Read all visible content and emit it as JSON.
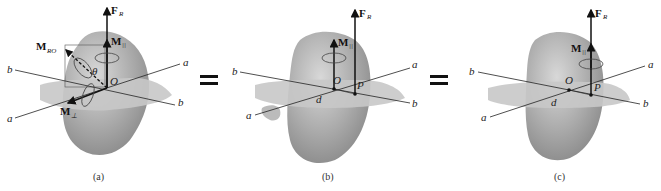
{
  "figure": {
    "panels": [
      {
        "id": "a",
        "caption": "(a)",
        "labels": {
          "force": "F",
          "force_sub": "R",
          "moment_total": "M",
          "moment_total_sub": "RO",
          "moment_parallel": "M",
          "moment_parallel_sub": "||",
          "moment_perp": "M",
          "moment_perp_sub": "⊥",
          "angle": "θ",
          "origin": "O",
          "axis_a1": "a",
          "axis_a2": "a",
          "axis_b1": "b",
          "axis_b2": "b"
        }
      },
      {
        "id": "b",
        "caption": "(b)",
        "labels": {
          "force": "F",
          "force_sub": "R",
          "moment_parallel": "M",
          "moment_parallel_sub": "||",
          "origin": "O",
          "point": "P",
          "distance": "d",
          "axis_a1": "a",
          "axis_a2": "a",
          "axis_b1": "b",
          "axis_b2": "b"
        }
      },
      {
        "id": "c",
        "caption": "(c)",
        "labels": {
          "force": "F",
          "force_sub": "R",
          "moment_parallel": "M",
          "moment_parallel_sub": "||",
          "origin": "O",
          "point": "P",
          "distance": "d",
          "axis_a1": "a",
          "axis_a2": "a",
          "axis_b1": "b",
          "axis_b2": "b"
        }
      }
    ],
    "equals": [
      "=",
      "="
    ],
    "colors": {
      "body": "#9a9a9a",
      "body_light": "#cfcfcf",
      "plane": "#c4c4c4",
      "line": "#1a1a1a"
    }
  }
}
